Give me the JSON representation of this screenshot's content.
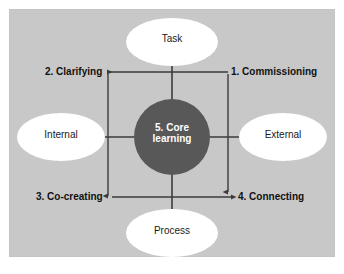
{
  "figure": {
    "background_color": "#ffffff",
    "panel_color": "#c8c8c8",
    "line_color": "#3b3b3b",
    "ellipse_fill": "#ffffff",
    "core_fill": "#585858",
    "core_text_color": "#ffffff",
    "label_text_color": "#111111"
  },
  "axes": {
    "top": {
      "label": "Task"
    },
    "bottom": {
      "label": "Process"
    },
    "left": {
      "label": "Internal"
    },
    "right": {
      "label": "External"
    }
  },
  "core": {
    "line1": "5. Core",
    "line2": "learning",
    "full_label": "5. Core learning"
  },
  "stages": [
    {
      "id": "commissioning",
      "label": "1. Commissioning",
      "position": "top-right"
    },
    {
      "id": "clarifying",
      "label": "2. Clarifying",
      "position": "top-left"
    },
    {
      "id": "cocreating",
      "label": "3. Co-creating",
      "position": "bottom-left"
    },
    {
      "id": "connecting",
      "label": "4. Connecting",
      "position": "bottom-right"
    }
  ],
  "arrows": [
    {
      "id": "top-arrow",
      "from": "1. Commissioning",
      "to": "2. Clarifying",
      "direction": "left"
    },
    {
      "id": "left-arrow",
      "from": "2. Clarifying",
      "to": "3. Co-creating",
      "direction": "down"
    },
    {
      "id": "bottom-arrow",
      "from": "3. Co-creating",
      "to": "4. Connecting",
      "direction": "right"
    },
    {
      "id": "right-arrow",
      "from": "1. Commissioning",
      "to": "4. Connecting",
      "direction": "down"
    }
  ]
}
